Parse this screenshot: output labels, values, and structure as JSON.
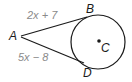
{
  "diagram": {
    "points": {
      "A": "A",
      "B": "B",
      "C": "C",
      "D": "D"
    },
    "segments": {
      "AB": "2x + 7",
      "AD": "5x − 8"
    },
    "colors": {
      "stroke": "#1a1a1a",
      "expression_text": "#8a8a8a"
    }
  }
}
